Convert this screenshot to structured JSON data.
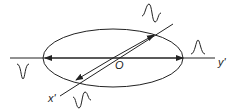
{
  "diagram": {
    "labels": {
      "origin": "O",
      "y_axis": "y'",
      "x_axis": "x'"
    },
    "shapes": {
      "ellipse": {
        "cx": 113,
        "cy": 58,
        "rx": 70,
        "ry": 29
      },
      "horizontal_axis": {
        "x1": 10,
        "y1": 58,
        "x2": 215,
        "y2": 58
      },
      "diagonal_axis": {
        "x1": 60,
        "y1": 96,
        "x2": 173,
        "y2": 24
      }
    },
    "pulses": [
      {
        "name": "upper-right-pulse",
        "position": "above diagonal axis top",
        "shape": "bipolar"
      },
      {
        "name": "right-pulse",
        "position": "right of ellipse on y' axis",
        "shape": "positive peak"
      },
      {
        "name": "left-pulse",
        "position": "left of ellipse below axis",
        "shape": "negative peak"
      },
      {
        "name": "lower-pulse",
        "position": "below diagonal axis bottom",
        "shape": "bipolar"
      }
    ],
    "colors": {
      "stroke": "#222222",
      "background": "#ffffff"
    }
  }
}
